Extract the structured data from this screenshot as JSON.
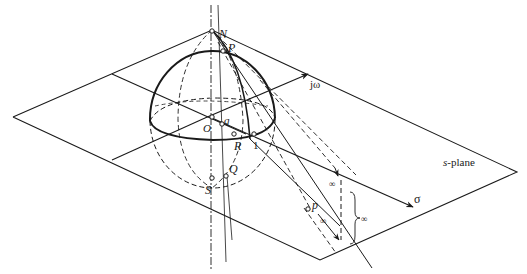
{
  "figure": {
    "plane_label_prefix": "s",
    "plane_label_suffix": "-plane",
    "axis_imag": "jω",
    "axis_real": "σ",
    "points": {
      "north": "N",
      "south": "S",
      "origin": "O",
      "P_upper": "P",
      "p_lower": "p",
      "q": "q",
      "Q": "Q",
      "R": "R",
      "one": "1"
    },
    "infinity_symbols": [
      "∞",
      "∞",
      "∞"
    ],
    "colors": {
      "line": "#1a1a1a",
      "background": "#ffffff"
    }
  }
}
